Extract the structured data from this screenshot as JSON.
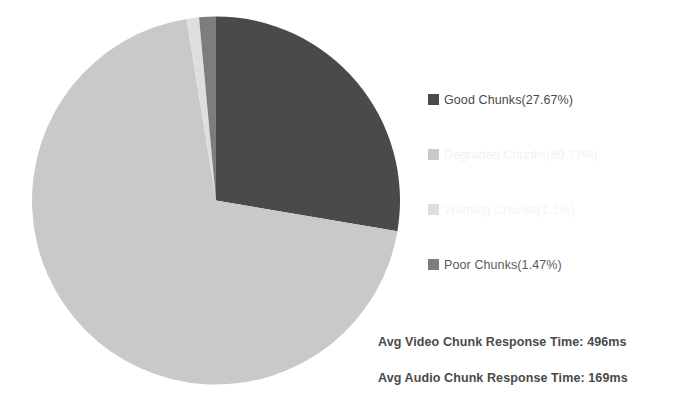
{
  "chart_data": {
    "type": "pie",
    "title": "",
    "categories": [
      "Good Chunks",
      "Degraded Chunks",
      "Warning Chunks",
      "Poor Chunks"
    ],
    "values": [
      27.67,
      69.77,
      1.1,
      1.47
    ],
    "unit": "%",
    "legend_position": "right",
    "start_angle_deg": 0,
    "direction": "clockwise",
    "grid": false,
    "slices": [
      {
        "label": "Good Chunks",
        "value": 27.67,
        "color": "#4a4a4a",
        "legend_text_color": "#4a4a4a"
      },
      {
        "label": "Degraded Chunks",
        "value": 69.77,
        "color": "#c9c9c9",
        "legend_text_color": "#f2f2f2"
      },
      {
        "label": "Warning Chunks",
        "value": 1.1,
        "color": "#dedede",
        "legend_text_color": "#f4f4f4"
      },
      {
        "label": "Poor Chunks",
        "value": 1.47,
        "color": "#7d7d7d",
        "legend_text_color": "#5a5a5a"
      }
    ]
  },
  "legend": {
    "items": [
      {
        "label": "Good Chunks(27.67%)"
      },
      {
        "label": "Degraded Chunks(69.77%)"
      },
      {
        "label": "Warning Chunks(1.1%)"
      },
      {
        "label": "Poor Chunks(1.47%)"
      }
    ]
  },
  "annotations": {
    "video_response_time": "Avg Video Chunk Response Time: 496ms",
    "audio_response_time": "Avg Audio Chunk Response Time: 169ms"
  }
}
